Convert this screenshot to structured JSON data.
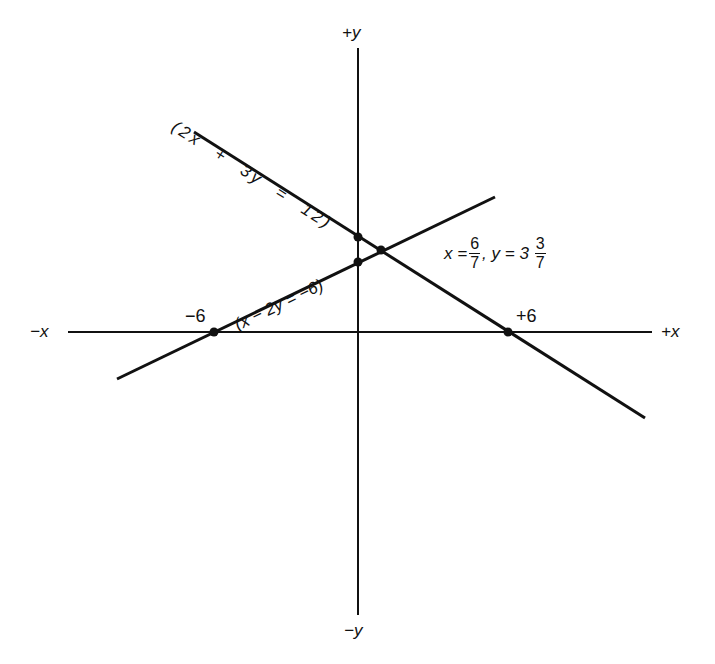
{
  "figure": {
    "type": "linear-system-graph",
    "axes": {
      "x_pos_label": "+x",
      "x_neg_label": "−x",
      "y_pos_label": "+y",
      "y_neg_label": "−y"
    },
    "ticks": {
      "neg_six": "−6",
      "pos_six": "+6"
    },
    "lines": [
      {
        "equation": "2x + 3y = 12",
        "label": "(2x  +  3y  =  12)",
        "x_intercept": 6,
        "y_intercept": 4
      },
      {
        "equation": "x − 2y = −6",
        "label": "(x − 2y = −6)",
        "x_intercept": -6,
        "y_intercept": 3
      }
    ],
    "solution": {
      "x_prefix": "x =",
      "x_num": "6",
      "x_den": "7",
      "sep": ", y = 3",
      "y_num": "3",
      "y_den": "7",
      "x_value": "6/7",
      "y_value": "3 3/7"
    },
    "stroke_color": "#111111",
    "background": "#ffffff"
  }
}
